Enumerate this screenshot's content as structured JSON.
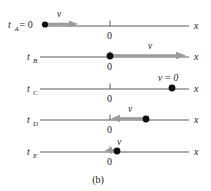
{
  "figure": {
    "caption": "(b)",
    "axis_label": "x",
    "origin_label": "0",
    "velocity_symbol": "v",
    "zero_velocity_label": "v = 0",
    "equals_zero": "= 0",
    "colors": {
      "axis": "#5a5a5a",
      "dot": "#0d0d0d",
      "arrow": "#9b9b9b",
      "text": "#1a1a1a",
      "background": "#ffffff"
    },
    "rows": [
      {
        "id": "A",
        "time_label": "t",
        "time_subscript": "A",
        "time_suffix": "= 0",
        "axis_label": "x",
        "origin_label": "0",
        "particle_position": "left-of-origin",
        "velocity_label": "v",
        "velocity_direction": "right",
        "velocity_magnitude": "medium"
      },
      {
        "id": "B",
        "time_label": "t",
        "time_subscript": "B",
        "time_suffix": "",
        "axis_label": "x",
        "origin_label": "0",
        "particle_position": "at-origin",
        "velocity_label": "v",
        "velocity_direction": "right",
        "velocity_magnitude": "large"
      },
      {
        "id": "C",
        "time_label": "t",
        "time_subscript": "C",
        "time_suffix": "",
        "axis_label": "x",
        "origin_label": "0",
        "particle_position": "right-of-origin",
        "velocity_label": "v = 0",
        "velocity_direction": "none",
        "velocity_magnitude": "zero"
      },
      {
        "id": "D",
        "time_label": "t",
        "time_subscript": "D",
        "time_suffix": "",
        "axis_label": "x",
        "origin_label": "0",
        "particle_position": "right-of-origin",
        "velocity_label": "v",
        "velocity_direction": "left",
        "velocity_magnitude": "medium"
      },
      {
        "id": "E",
        "time_label": "t",
        "time_subscript": "E",
        "time_suffix": "",
        "axis_label": "x",
        "origin_label": "0",
        "particle_position": "near-origin-right",
        "velocity_label": "v",
        "velocity_direction": "left",
        "velocity_magnitude": "small"
      }
    ]
  }
}
